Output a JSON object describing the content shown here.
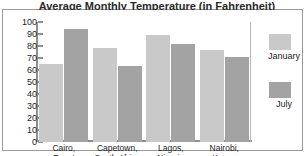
{
  "chart_data": {
    "type": "bar",
    "title": "Average Monthly Temperature (in Fahrenheit)",
    "xlabel": "",
    "ylabel": "",
    "ylim": [
      0,
      100
    ],
    "yticks": [
      100,
      90,
      80,
      70,
      60,
      50,
      40,
      30,
      20,
      10,
      0
    ],
    "grid": false,
    "legend_position": "right",
    "categories": [
      "Cairo,\nEgypt",
      "Capetown,\nSouth Africa",
      "Lagos,\nNigeria",
      "Nairobi,\nKenya"
    ],
    "category_lines": [
      [
        "Cairo,",
        "Egypt"
      ],
      [
        "Capetown,",
        "South Africa"
      ],
      [
        "Lagos,",
        "Nigeria"
      ],
      [
        "Nairobi,",
        "Kenya"
      ]
    ],
    "series": [
      {
        "name": "January",
        "color": "#c9c9c9",
        "values": [
          65,
          78,
          89,
          77
        ]
      },
      {
        "name": "July",
        "color": "#a3a3a3",
        "values": [
          94,
          63,
          82,
          71
        ]
      }
    ]
  },
  "legend": {
    "entries": [
      {
        "label": "January",
        "color": "#c9c9c9"
      },
      {
        "label": "July",
        "color": "#a3a3a3"
      }
    ]
  },
  "axis": {
    "y_labels": [
      "100",
      "90",
      "80",
      "70",
      "60",
      "50",
      "40",
      "30",
      "20",
      "10",
      "0"
    ]
  }
}
